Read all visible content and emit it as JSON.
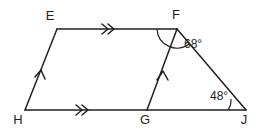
{
  "figure": {
    "stroke_color": "#231f20",
    "background_color": "#ffffff",
    "width": 264,
    "height": 130,
    "vertices": [
      {
        "id": "E",
        "label": "E",
        "x": 57,
        "y": 29,
        "label_x": 50,
        "label_y": 20
      },
      {
        "id": "F",
        "label": "F",
        "x": 177,
        "y": 29,
        "label_x": 176,
        "label_y": 19
      },
      {
        "id": "H",
        "label": "H",
        "x": 25,
        "y": 110,
        "label_x": 18,
        "label_y": 124
      },
      {
        "id": "G",
        "label": "G",
        "x": 147,
        "y": 110,
        "label_x": 145,
        "label_y": 124
      },
      {
        "id": "J",
        "label": "J",
        "x": 246,
        "y": 110,
        "label_x": 244,
        "label_y": 124
      }
    ],
    "segments": [
      {
        "id": "EF",
        "from": "E",
        "to": "F",
        "marks": 2,
        "mark_style": "chevron"
      },
      {
        "id": "HJ",
        "from": "H",
        "to": "J",
        "marks": 2,
        "mark_style": "chevron"
      },
      {
        "id": "EH",
        "from": "H",
        "to": "E",
        "marks": 1,
        "mark_style": "chevron"
      },
      {
        "id": "GF",
        "from": "G",
        "to": "F",
        "marks": 1,
        "mark_style": "chevron"
      },
      {
        "id": "FJ",
        "from": "F",
        "to": "J",
        "marks": 0,
        "mark_style": "none"
      }
    ],
    "angles": [
      {
        "id": "angle-F",
        "vertex": "F",
        "value": "68°",
        "label_x": 184,
        "label_y": 48
      },
      {
        "id": "angle-J",
        "vertex": "J",
        "value": "48°",
        "label_x": 210,
        "label_y": 100
      }
    ],
    "parallel_sets": [
      {
        "id": "set-double",
        "members": [
          "EF",
          "HJ"
        ],
        "marks": 2
      },
      {
        "id": "set-single",
        "members": [
          "EH",
          "GF"
        ],
        "marks": 1
      }
    ]
  }
}
